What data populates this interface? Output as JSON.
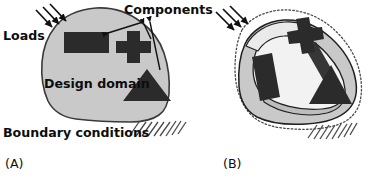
{
  "figure": {
    "kind": "two-panel-diagram",
    "background_color": "#ffffff",
    "width": 378,
    "height": 178
  },
  "labels": {
    "loads": "Loads",
    "components": "Components",
    "design_domain": "Design domain",
    "boundary_conditions": "Boundary conditions",
    "panel_a": "(A)",
    "panel_b": "(B)"
  },
  "colors": {
    "domain_fill": "#c9c9c9",
    "domain_stroke": "#3a3a3a",
    "component_fill": "#2b2b2b",
    "structure_fill": "#c9c9c9",
    "void_fill": "#f2f2f2",
    "outline_dotted": "#4a4a4a",
    "text": "#0d0d0d",
    "hatch": "#4a4a4a",
    "arrow": "#111111"
  },
  "panel_a": {
    "name": "design-domain-panel",
    "label": "(A)",
    "domain": {
      "name": "design-domain-blob",
      "description": "irregular closed gray region"
    },
    "loads": {
      "name": "load-arrows",
      "count": 3,
      "direction": "down-right",
      "label": "Loads"
    },
    "boundary_conditions": {
      "name": "boundary-condition-hatch",
      "label": "Boundary conditions",
      "hatch_lines": 9
    },
    "components": [
      {
        "name": "component-rectangle",
        "shape": "rectangle"
      },
      {
        "name": "component-cross",
        "shape": "cross"
      },
      {
        "name": "component-triangle",
        "shape": "triangle"
      }
    ]
  },
  "panel_b": {
    "name": "optimized-result-panel",
    "label": "(B)",
    "dotted_outline": {
      "name": "original-domain-dotted-outline",
      "style": "dotted"
    },
    "loads": {
      "name": "load-arrows",
      "count": 3,
      "direction": "down-right"
    },
    "boundary_conditions": {
      "name": "boundary-condition-hatch",
      "hatch_lines": 8
    },
    "components": [
      {
        "name": "component-rectangle",
        "shape": "rectangle",
        "state": "rotated"
      },
      {
        "name": "component-cross",
        "shape": "cross",
        "state": "rotated"
      },
      {
        "name": "component-triangle",
        "shape": "triangle",
        "state": "moved"
      }
    ],
    "structure": {
      "name": "optimized-structure",
      "description": "gray material ring with interior voids connecting the components"
    }
  }
}
